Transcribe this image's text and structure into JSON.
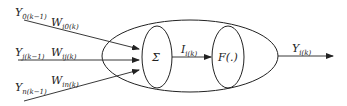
{
  "diagram": {
    "inputs": [
      {
        "signal_base": "Y",
        "signal_sub": "0(k−1)",
        "weight_base": "W",
        "weight_sub": "i0(k)"
      },
      {
        "signal_base": "Y",
        "signal_sub": "j(k−1)",
        "weight_base": "W",
        "weight_sub": "ij(k)"
      },
      {
        "signal_base": "Y",
        "signal_sub": "n(k−1)",
        "weight_base": "W",
        "weight_sub": "in(k)"
      }
    ],
    "summation": {
      "symbol": "Σ"
    },
    "intermediate": {
      "base": "I",
      "sub": "i(k)"
    },
    "activation": {
      "label": "F(.)"
    },
    "output": {
      "base": "Y",
      "sub": "i(k)"
    },
    "colors": {
      "stroke": "#222222",
      "background": "#ffffff"
    }
  }
}
